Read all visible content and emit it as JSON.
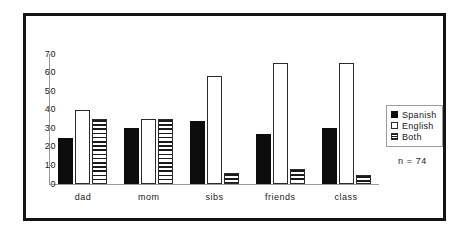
{
  "chart_data": {
    "type": "bar",
    "title": "",
    "xlabel": "",
    "ylabel": "",
    "categories": [
      "dad",
      "mom",
      "sibs",
      "friends",
      "class"
    ],
    "series": [
      {
        "name": "Spanish",
        "values": [
          25,
          30,
          34,
          27,
          30
        ],
        "style": "solid-black"
      },
      {
        "name": "English",
        "values": [
          40,
          35,
          58,
          65,
          65
        ],
        "style": "white-outline"
      },
      {
        "name": "Both",
        "values": [
          35,
          35,
          6,
          8,
          5
        ],
        "style": "horizontal-hatch"
      }
    ],
    "ylim": [
      0,
      70
    ],
    "ytick_labels": [
      "70",
      "60",
      "50",
      "40",
      "30",
      "20",
      "10",
      "0"
    ],
    "ytick_values": [
      70,
      60,
      50,
      40,
      30,
      20,
      10,
      0
    ],
    "grid": false,
    "legend_position": "right",
    "annotation": "n = 74"
  },
  "legend": {
    "entries": [
      {
        "label": "Spanish"
      },
      {
        "label": "English"
      },
      {
        "label": "Both"
      }
    ]
  },
  "colors": {
    "frame": "#141414",
    "axis": "#9a9a9a",
    "spanish": "#0d0d0d",
    "english": "#ffffff",
    "both_hatch": "#1a1a1a",
    "text": "#1a1a1a",
    "background": "#ffffff"
  }
}
